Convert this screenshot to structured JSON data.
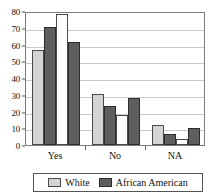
{
  "chart_data": {
    "type": "bar",
    "title": "",
    "subtitle": "",
    "xlabel": "",
    "ylabel": "",
    "categories": [
      "Yes",
      "No",
      "NA"
    ],
    "ylim": [
      0,
      80
    ],
    "ytick_labels": [
      "0",
      "10",
      "20",
      "30",
      "40",
      "50",
      "60",
      "70",
      "80"
    ],
    "ytick_values": [
      0,
      10,
      20,
      30,
      40,
      50,
      60,
      70,
      80
    ],
    "grid": true,
    "grid_axis": "y",
    "legend_position": "bottom",
    "legend": [
      "White",
      "African American"
    ],
    "bars_per_group": 4,
    "series": [
      {
        "name": "White",
        "group_slot": 1,
        "style": "light",
        "values": [
          56.5,
          30.5,
          12.0
        ]
      },
      {
        "name": "African American",
        "group_slot": 2,
        "style": "dark",
        "values": [
          70.3,
          23.2,
          6.5
        ]
      },
      {
        "name": "White",
        "group_slot": 3,
        "style": "white",
        "values": [
          78.5,
          18.2,
          3.5
        ]
      },
      {
        "name": "African American",
        "group_slot": 4,
        "style": "dark",
        "values": [
          61.3,
          28.0,
          10.0
        ]
      }
    ]
  },
  "legend": {
    "entries": [
      {
        "label": "White",
        "style": "light",
        "swatch_color": "#d5d5d5"
      },
      {
        "label": "African American",
        "style": "dark",
        "swatch_color": "#5e5e5e"
      }
    ]
  },
  "colors": {
    "light_bar": "#d5d5d5",
    "dark_bar": "#5e5e5e",
    "white_bar": "#fdfdfd",
    "bar_outline": "#4a4a4a",
    "gridline": "#c9c9c9",
    "frame": "#7a7a7a",
    "background": "#ffffff",
    "text": "#111111"
  }
}
